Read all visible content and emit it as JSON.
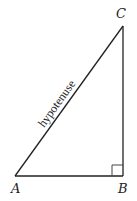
{
  "diagram": {
    "type": "right-triangle",
    "vertices": {
      "A": {
        "label": "A",
        "x": 15,
        "y": 176
      },
      "B": {
        "label": "B",
        "x": 123,
        "y": 176
      },
      "C": {
        "label": "C",
        "x": 123,
        "y": 26
      }
    },
    "right_angle_at": "B",
    "side_labels": {
      "AC": "hypotenuse"
    },
    "colors": {
      "stroke": "#222222",
      "background": "#ffffff"
    }
  }
}
